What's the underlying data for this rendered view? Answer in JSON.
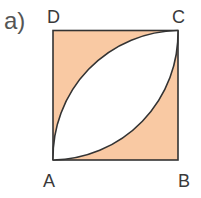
{
  "figure": {
    "part_label": "a)",
    "vertices": {
      "A": "A",
      "B": "B",
      "C": "C",
      "D": "D"
    },
    "shape": "square with two quarter-circle arcs from A to C forming a lens",
    "colors": {
      "fill": "#f9c9a3",
      "stroke": "#333333",
      "lens": "#ffffff"
    }
  }
}
